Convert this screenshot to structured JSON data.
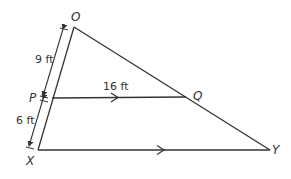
{
  "diagram": {
    "points": {
      "O": {
        "label": "O",
        "x": 74,
        "y": 27
      },
      "P": {
        "label": "P",
        "x": 52,
        "y": 98
      },
      "X": {
        "label": "X",
        "x": 38,
        "y": 150
      },
      "Q": {
        "label": "Q",
        "x": 186,
        "y": 97
      },
      "Y": {
        "label": "Y",
        "x": 270,
        "y": 150
      }
    },
    "measurements": {
      "OP": "9 ft",
      "PX": "6 ft",
      "PQ": "16 ft"
    },
    "parallel_segments": [
      "PQ",
      "XY"
    ],
    "colors": {
      "stroke": "#333333",
      "background": "#ffffff"
    }
  }
}
